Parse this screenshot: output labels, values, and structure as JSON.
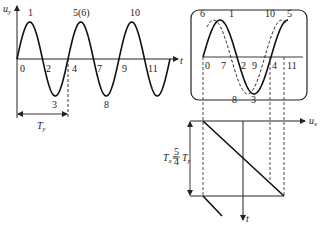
{
  "left_plot": {
    "y_axis_label": "u",
    "y_axis_sub": "y",
    "x_axis_label": "t",
    "point_labels": [
      {
        "text": "0",
        "x": 20,
        "y": 72
      },
      {
        "text": "1",
        "x": 28,
        "y": 16
      },
      {
        "text": "2",
        "x": 46,
        "y": 72
      },
      {
        "text": "3",
        "x": 52,
        "y": 108
      },
      {
        "text": "4",
        "x": 72,
        "y": 72
      },
      {
        "text": "5(6)",
        "x": 73,
        "y": 16
      },
      {
        "text": "7",
        "x": 97,
        "y": 72
      },
      {
        "text": "8",
        "x": 104,
        "y": 108
      },
      {
        "text": "9",
        "x": 122,
        "y": 72
      },
      {
        "text": "10",
        "x": 130,
        "y": 16
      },
      {
        "text": "11",
        "x": 148,
        "y": 72
      }
    ],
    "period_label": "T",
    "period_sub": "y"
  },
  "screen": {
    "solid_labels": [
      {
        "text": "0",
        "x": 205,
        "y": 69
      },
      {
        "text": "1",
        "x": 229,
        "y": 17
      },
      {
        "text": "2",
        "x": 241,
        "y": 69
      },
      {
        "text": "3",
        "x": 251,
        "y": 103
      },
      {
        "text": "4",
        "x": 272,
        "y": 69
      },
      {
        "text": "5",
        "x": 287,
        "y": 17
      }
    ],
    "dashed_labels": [
      {
        "text": "6",
        "x": 200,
        "y": 17
      },
      {
        "text": "7",
        "x": 221,
        "y": 69
      },
      {
        "text": "8",
        "x": 232,
        "y": 103
      },
      {
        "text": "9",
        "x": 252,
        "y": 69
      },
      {
        "text": "10",
        "x": 265,
        "y": 17
      },
      {
        "text": "11",
        "x": 287,
        "y": 69
      }
    ]
  },
  "sweep": {
    "x_axis_label": "u",
    "x_axis_sub": "x",
    "t_axis_label": "t",
    "period_eq": "T",
    "period_eq_sub": "x",
    "frac_num": "5",
    "frac_den": "4",
    "period_ty": "T",
    "period_ty_sub": "y"
  }
}
